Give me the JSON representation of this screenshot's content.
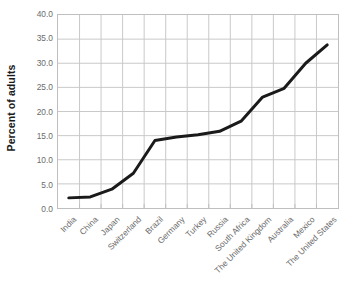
{
  "chart_data": {
    "type": "line",
    "title": "",
    "xlabel": "",
    "ylabel": "Percent of adults",
    "categories": [
      "India",
      "China",
      "Japan",
      "Switzerland",
      "Brazil",
      "Germany",
      "Turkey",
      "Russia",
      "South Africa",
      "The United Kingdom",
      "Australia",
      "Mexico",
      "The United States"
    ],
    "values": [
      2.1,
      2.3,
      3.9,
      7.2,
      14.0,
      14.7,
      15.2,
      15.9,
      18.0,
      23.0,
      24.8,
      30.0,
      33.8
    ],
    "series": [
      {
        "name": "Percent of adults",
        "values": [
          2.1,
          2.3,
          3.9,
          7.2,
          14.0,
          14.7,
          15.2,
          15.9,
          18.0,
          23.0,
          24.8,
          30.0,
          33.8
        ]
      }
    ],
    "ylim": [
      0.0,
      40.0
    ],
    "ytick_values": [
      0.0,
      5.0,
      10.0,
      15.0,
      20.0,
      25.0,
      30.0,
      35.0,
      40.0
    ],
    "ytick_labels": [
      "0.0",
      "5.0",
      "10.0",
      "15.0",
      "20.0",
      "25.0",
      "30.0",
      "35.0",
      "40.0"
    ],
    "grid": true,
    "grid_x": true,
    "grid_y": true,
    "legend": false,
    "legend_position": "none",
    "line_color": "#1a1a1a",
    "line_width": 3,
    "markers": false,
    "grid_color": "#c8c8c8",
    "axis_color": "#bfbfbf",
    "tick_label_color": "#6b6b6b",
    "background_color": "#ffffff"
  }
}
